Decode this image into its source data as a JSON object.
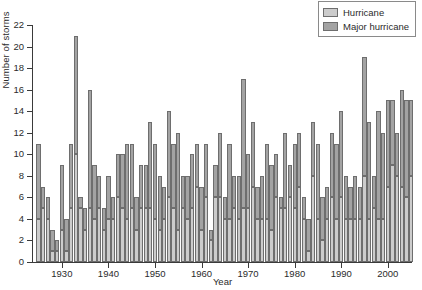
{
  "chart_data": {
    "type": "bar",
    "title": "",
    "subtitle": "",
    "xlabel": "Year",
    "ylabel": "Number of storms",
    "xlim": [
      1924.3,
      2005.7
    ],
    "ylim": [
      0,
      22
    ],
    "yticks": [
      0,
      2,
      4,
      6,
      8,
      10,
      12,
      14,
      16,
      18,
      20,
      22
    ],
    "xticks": [
      1930,
      1940,
      1950,
      1960,
      1970,
      1980,
      1990,
      2000
    ],
    "grid": false,
    "stacked": true,
    "legend_position": "top-right",
    "colors": {
      "hurricane": "#cccccc",
      "major_hurricane": "#a3a3a3",
      "bar_outline": "#6e6e6e",
      "axis": "#3a3a3a",
      "text": "#2b2b2b"
    },
    "legend": [
      {
        "label": "Hurricane",
        "color": "#cccccc"
      },
      {
        "label": "Major hurricane",
        "color": "#a3a3a3"
      }
    ],
    "series": [
      {
        "name": "Hurricane",
        "key": "hurricane",
        "color": "#cccccc"
      },
      {
        "name": "Major hurricane",
        "key": "major_hurricane",
        "color": "#a3a3a3"
      }
    ],
    "x": [
      1925,
      1926,
      1927,
      1928,
      1929,
      1930,
      1931,
      1932,
      1933,
      1934,
      1935,
      1936,
      1937,
      1938,
      1939,
      1940,
      1941,
      1942,
      1943,
      1944,
      1945,
      1946,
      1947,
      1948,
      1949,
      1950,
      1951,
      1952,
      1953,
      1954,
      1955,
      1956,
      1957,
      1958,
      1959,
      1960,
      1961,
      1962,
      1963,
      1964,
      1965,
      1966,
      1967,
      1968,
      1969,
      1970,
      1971,
      1972,
      1973,
      1974,
      1975,
      1976,
      1977,
      1978,
      1979,
      1980,
      1981,
      1982,
      1983,
      1984,
      1985,
      1986,
      1987,
      1988,
      1989,
      1990,
      1991,
      1992,
      1993,
      1994,
      1995,
      1996,
      1997,
      1998,
      1999,
      2000,
      2001,
      2002,
      2003,
      2004,
      2005
    ],
    "totals": [
      11,
      7,
      6,
      3,
      2,
      9,
      4,
      11,
      21,
      6,
      5,
      16,
      9,
      8,
      5,
      8,
      6,
      10,
      10,
      11,
      11,
      6,
      9,
      9,
      13,
      11,
      8,
      7,
      14,
      11,
      12,
      8,
      8,
      10,
      11,
      7,
      11,
      3,
      9,
      12,
      6,
      11,
      8,
      8,
      17,
      10,
      13,
      7,
      8,
      11,
      9,
      10,
      6,
      12,
      9,
      11,
      12,
      6,
      4,
      13,
      11,
      6,
      7,
      12,
      11,
      14,
      8,
      7,
      8,
      7,
      19,
      13,
      8,
      14,
      12,
      15,
      15,
      12,
      16,
      15,
      15
    ],
    "hurricane": [
      4,
      5,
      4,
      1,
      1,
      3,
      1,
      5,
      10,
      5,
      3,
      5,
      4,
      5,
      3,
      4,
      4,
      6,
      5,
      4,
      5,
      3,
      5,
      5,
      5,
      4,
      3,
      4,
      6,
      5,
      3,
      5,
      4,
      5,
      7,
      3,
      6,
      2,
      6,
      6,
      4,
      4,
      5,
      4,
      5,
      5,
      7,
      4,
      4,
      4,
      3,
      6,
      5,
      5,
      6,
      5,
      7,
      4,
      1,
      8,
      4,
      2,
      4,
      6,
      4,
      6,
      4,
      4,
      4,
      4,
      8,
      4,
      5,
      4,
      4,
      7,
      9,
      8,
      7,
      6,
      8
    ],
    "major_hurricane": [
      7,
      2,
      2,
      2,
      1,
      6,
      3,
      6,
      11,
      1,
      2,
      11,
      5,
      3,
      2,
      4,
      2,
      4,
      5,
      7,
      6,
      3,
      4,
      4,
      8,
      7,
      5,
      3,
      8,
      6,
      9,
      3,
      4,
      5,
      4,
      4,
      5,
      1,
      3,
      6,
      2,
      7,
      3,
      4,
      12,
      5,
      6,
      3,
      4,
      7,
      6,
      4,
      1,
      7,
      3,
      6,
      5,
      2,
      3,
      5,
      7,
      4,
      3,
      6,
      7,
      8,
      4,
      3,
      4,
      3,
      11,
      9,
      3,
      10,
      8,
      8,
      6,
      4,
      9,
      9,
      7
    ]
  }
}
